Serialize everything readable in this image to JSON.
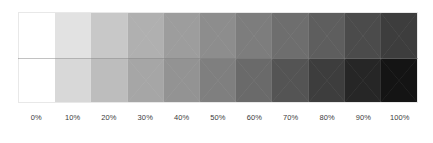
{
  "chart_data": {
    "type": "heatmap",
    "title": "",
    "subtitle": "",
    "xlabel": "",
    "ylabel": "",
    "grid": false,
    "legend_position": "none",
    "categories": [
      "0%",
      "10%",
      "20%",
      "30%",
      "40%",
      "50%",
      "60%",
      "70%",
      "80%",
      "90%",
      "100%"
    ],
    "x": [
      0,
      10,
      20,
      30,
      40,
      50,
      60,
      70,
      80,
      90,
      100
    ],
    "xlim": [
      0,
      100
    ],
    "tick_labels": [
      "0%",
      "10%",
      "20%",
      "30%",
      "40%",
      "50%",
      "60%",
      "70%",
      "80%",
      "90%",
      "100%"
    ],
    "series": [
      {
        "name": "top-row",
        "values": [
          0,
          10,
          20,
          30,
          40,
          50,
          60,
          70,
          80,
          90,
          100
        ],
        "colors": [
          "#ffffff",
          "#e2e2e2",
          "#c8c8c8",
          "#b0b0b0",
          "#9d9d9d",
          "#8d8d8d",
          "#7d7d7d",
          "#6e6e6e",
          "#5e5e5e",
          "#4b4b4b",
          "#3d3d3d"
        ]
      },
      {
        "name": "bottom-row",
        "values": [
          0,
          10,
          20,
          30,
          40,
          50,
          60,
          70,
          80,
          90,
          100
        ],
        "colors": [
          "#ffffff",
          "#d8d8d8",
          "#bdbdbd",
          "#a6a6a6",
          "#939393",
          "#7f7f7f",
          "#6a6a6a",
          "#545454",
          "#3d3d3d",
          "#262626",
          "#141414"
        ]
      }
    ]
  },
  "colors": {
    "background": "#ffffff",
    "frame_border": "#e8e8e8",
    "row_divider": "#787878",
    "label_text": "#3b3b3b"
  }
}
